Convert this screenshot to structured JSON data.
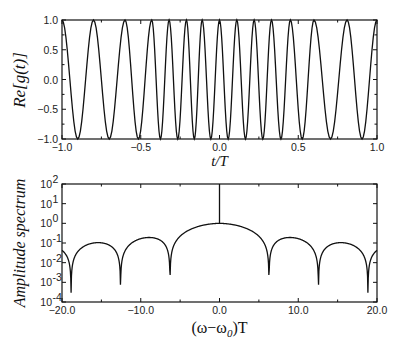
{
  "chart_data": [
    {
      "type": "line",
      "title": "",
      "xlabel": "t/T",
      "ylabel": "Re[g(t)]",
      "xlim": [
        -1.0,
        1.0
      ],
      "ylim": [
        -1.0,
        1.0
      ],
      "xticks": [
        "-1.0",
        "-0.5",
        "0.0",
        "0.5",
        "1.0"
      ],
      "yticks": [
        "-1.0",
        "-0.5",
        "0.0",
        "0.5",
        "1.0"
      ],
      "grid": false,
      "legend": null,
      "description": "Chirped cosine oscillation between -1 and 1; local frequency highest near t=0 and lowest near t=±1",
      "series": [
        {
          "name": "Re[g(t)]",
          "crest_t": [
            -1.0,
            -0.8,
            -0.6,
            -0.43,
            -0.32,
            -0.21,
            -0.11,
            0.0,
            0.11,
            0.22,
            0.33,
            0.45,
            0.6,
            0.81,
            1.0
          ],
          "crest_value": 1.0,
          "trough_value": -1.0
        }
      ]
    },
    {
      "type": "line",
      "title": "",
      "xlabel": "(ω−ω0)T",
      "ylabel": "Amplitude spectrum",
      "yscale": "log",
      "xlim": [
        -20.0,
        20.0
      ],
      "ylim": [
        0.0001,
        100
      ],
      "xticks": [
        "-20.0",
        "-10.0",
        "0.0",
        "10.0",
        "20.0"
      ],
      "yticks": [
        "10^-4",
        "10^-3",
        "10^-2",
        "10^-1",
        "10^0",
        "10^1",
        "10^2"
      ],
      "grid": false,
      "legend": null,
      "description": "sinc-like amplitude spectrum with main lobe peak ~1 at 0, nulls at ±2π, ±4π, ±6π, and a vertical spike at 0 reaching 10^2",
      "series": [
        {
          "name": "Amplitude spectrum",
          "main_lobe_peak": {
            "x": 0.0,
            "y": 1.0
          },
          "spike": {
            "x": 0.0,
            "y_from": 1.0,
            "y_to": 100
          },
          "nulls_x": [
            -18.85,
            -12.57,
            -6.28,
            6.28,
            12.57,
            18.85
          ],
          "null_depth": 0.0003,
          "side_lobe_peaks": [
            {
              "x": -15.4,
              "y": 0.08
            },
            {
              "x": -9.2,
              "y": 0.15
            },
            {
              "x": 9.2,
              "y": 0.15
            },
            {
              "x": 15.4,
              "y": 0.08
            }
          ],
          "edge_values": {
            "x_-20": 0.028,
            "x_20": 0.025
          }
        }
      ]
    }
  ],
  "top": {
    "ylabel": "Re[g(t)]",
    "xlabel": "t/T",
    "xtick_labels": [
      "−1.0",
      "−0.5",
      "0.0",
      "0.5",
      "1.0"
    ],
    "ytick_labels": [
      "1.0",
      "0.5",
      "0.0",
      "−0.5",
      "−1.0"
    ]
  },
  "bottom": {
    "ylabel": "Amplitude spectrum",
    "xlabel_main": "(ω−ω",
    "xlabel_sub": "0",
    "xlabel_end": ")T",
    "xtick_labels": [
      "−20.0",
      "−10.0",
      "0.0",
      "10.0",
      "20.0"
    ],
    "ytick_exponents": [
      "2",
      "1",
      "0",
      "-1",
      "-2",
      "-3",
      "-4"
    ]
  }
}
